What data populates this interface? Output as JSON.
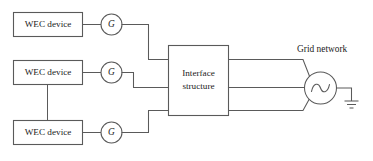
{
  "figure": {
    "type": "block-diagram",
    "background_color": "#ffffff",
    "line_color": "#5a5a5a",
    "text_color": "#1c1c1c"
  },
  "sources": {
    "label": "WEC device",
    "devices": [
      {
        "label": "WEC device"
      },
      {
        "label": "WEC device"
      },
      {
        "label": "WEC device"
      }
    ]
  },
  "generators": {
    "symbol": "G",
    "items": [
      {
        "label": "G"
      },
      {
        "label": "G"
      },
      {
        "label": "G"
      }
    ]
  },
  "interface": {
    "line1": "Interface",
    "line2": "structure"
  },
  "grid": {
    "label": "Grid network",
    "source_symbol": "ac-source",
    "ground_symbol": "earth-ground"
  },
  "icons": {
    "generator": "generator-icon",
    "ac_source": "ac-source-icon",
    "ground": "ground-icon"
  }
}
